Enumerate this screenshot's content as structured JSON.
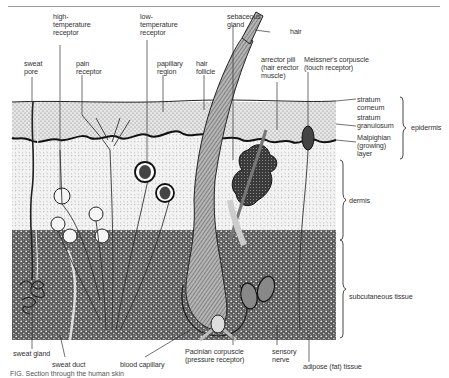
{
  "diagram": {
    "title": "Section through the human skin",
    "top_labels": {
      "sweat_pore": [
        "sweat",
        "pore"
      ],
      "high_temp_receptor": [
        "high-",
        "temperature",
        "receptor"
      ],
      "pain_receptor": [
        "pain",
        "receptor"
      ],
      "low_temp_receptor": [
        "low-",
        "temperature",
        "receptor"
      ],
      "papillary_region": [
        "papillary",
        "region"
      ],
      "hair_follicle": [
        "hair",
        "follicle"
      ],
      "sebaceous_gland": [
        "sebaceous",
        "gland"
      ],
      "hair": "hair",
      "arrector_pili": [
        "arrector pili",
        "(hair erector",
        "muscle)"
      ],
      "meissners_corpuscle": [
        "Meissner's corpuscle",
        "(touch receptor)"
      ]
    },
    "right_labels": {
      "stratum_corneum": [
        "stratum",
        "corneum"
      ],
      "stratum_granulosum": [
        "stratum",
        "granulosum"
      ],
      "malpighian_layer": [
        "Malpighian",
        "(growing)",
        "layer"
      ],
      "epidermis": "epidermis",
      "dermis": "dermis",
      "subcutaneous_tissue": "subcutaneous tissue"
    },
    "bottom_labels": {
      "sweat_gland": "sweat gland",
      "sweat_duct": "sweat duct",
      "blood_capillary": "blood capillary",
      "pacinian_corpuscle": [
        "Pacinian corpuscle",
        "(pressure receptor)"
      ],
      "sensory_nerve": [
        "sensory",
        "nerve"
      ],
      "adipose_tissue": "adipose (fat) tissue"
    },
    "caption": "FIG. Section through the human skin",
    "colors": {
      "ink": "#1e1e1e",
      "label_text": "#333333",
      "epidermis_fill": "#d9d9d9",
      "dermis_fill": "#eeeeee",
      "subcutaneous_fill": "#6e6e6e",
      "hair_fill": "#8a8a8a"
    }
  }
}
